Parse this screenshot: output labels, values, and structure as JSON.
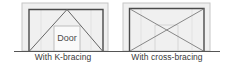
{
  "figure": {
    "panels": [
      {
        "id": "k-bracing",
        "caption": "With K-bracing",
        "door_label": "Door",
        "bracing_type": "K-bracing",
        "has_door": true
      },
      {
        "id": "cross-bracing",
        "caption": "With cross-bracing",
        "bracing_type": "cross-bracing",
        "has_door": false
      }
    ]
  },
  "colors": {
    "frame": "#4a4a4a",
    "panel_fill": "#eeeeee",
    "panel_border": "#c8c8c8",
    "brace": "#6a6a6a",
    "ground": "#555555",
    "caption_text": "#3a3a3a"
  }
}
